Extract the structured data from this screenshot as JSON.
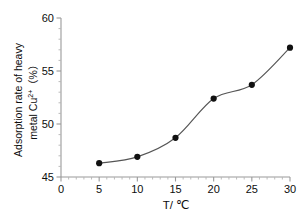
{
  "chart_data": {
    "type": "line",
    "title": "",
    "subtitle": "",
    "xlabel": "T/ ℃",
    "ylabel_line1": "Adsorption rate of heavy",
    "ylabel_line2_prefix": "metal Cu",
    "ylabel_line2_sup": "2+",
    "ylabel_line2_suffix": "（%）",
    "x": [
      5,
      10,
      15,
      20,
      25,
      30
    ],
    "values": [
      46.3,
      46.9,
      48.7,
      52.4,
      53.7,
      57.2
    ],
    "series": [
      {
        "name": "Adsorption rate of heavy metal Cu2+ (%)",
        "values": [
          46.3,
          46.9,
          48.7,
          52.4,
          53.7,
          57.2
        ]
      }
    ],
    "xlim": [
      0,
      30
    ],
    "ylim": [
      45,
      60
    ],
    "xticks": [
      0,
      5,
      10,
      15,
      20,
      25,
      30
    ],
    "yticks": [
      45,
      50,
      55,
      60
    ],
    "x_minor_tick_step": 1,
    "y_minor_tick_step": 1,
    "grid": false,
    "legend": false,
    "legend_position": "none",
    "marker": "filled-circle",
    "marker_color": "#111111",
    "line_color": "#555555",
    "axis_color": "#9a9a9a",
    "background_color": "#ffffff"
  },
  "axes": {
    "x_tick_labels": [
      "0",
      "5",
      "10",
      "15",
      "20",
      "25",
      "30"
    ],
    "y_tick_labels": [
      "45",
      "50",
      "55",
      "60"
    ]
  }
}
